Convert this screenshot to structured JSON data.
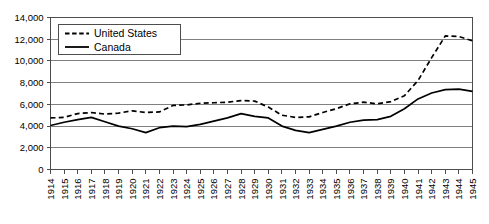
{
  "chart_data": {
    "type": "line",
    "title": "",
    "xlabel": "",
    "ylabel": "",
    "x": [
      1914,
      1915,
      1916,
      1917,
      1918,
      1919,
      1920,
      1921,
      1922,
      1923,
      1924,
      1925,
      1926,
      1927,
      1928,
      1929,
      1930,
      1931,
      1932,
      1933,
      1934,
      1935,
      1936,
      1937,
      1938,
      1939,
      1940,
      1941,
      1942,
      1943,
      1944,
      1945
    ],
    "xtick_labels": [
      "1914",
      "1915",
      "1916",
      "1917",
      "1918",
      "1919",
      "1920",
      "1921",
      "1922",
      "1923",
      "1924",
      "1925",
      "1926",
      "1927",
      "1928",
      "1929",
      "1930",
      "1931",
      "1932",
      "1933",
      "1934",
      "1935",
      "1936",
      "1937",
      "1938",
      "1939",
      "1940",
      "1941",
      "1942",
      "1943",
      "1944",
      "1945"
    ],
    "ytick_labels": [
      "0",
      "2,000",
      "4,000",
      "6,000",
      "8,000",
      "10,000",
      "12,000",
      "14,000"
    ],
    "yticks": [
      0,
      2000,
      4000,
      6000,
      8000,
      10000,
      12000,
      14000
    ],
    "ylim": [
      0,
      14000
    ],
    "grid": true,
    "legend_position": "top-left",
    "series": [
      {
        "name": "United States",
        "style": "dashed",
        "color": "#000000",
        "values": [
          4750,
          4800,
          5150,
          5250,
          5100,
          5200,
          5400,
          5250,
          5300,
          5900,
          5950,
          6100,
          6150,
          6200,
          6350,
          6300,
          5750,
          5000,
          4800,
          4850,
          5250,
          5600,
          6050,
          6200,
          6050,
          6250,
          6800,
          8200,
          10300,
          12300,
          12250,
          11850
        ]
      },
      {
        "name": "Canada",
        "style": "solid",
        "color": "#000000",
        "values": [
          4050,
          4350,
          4600,
          4800,
          4400,
          4000,
          3750,
          3400,
          3850,
          4000,
          3950,
          4150,
          4450,
          4750,
          5150,
          4900,
          4750,
          4000,
          3600,
          3400,
          3700,
          4000,
          4350,
          4550,
          4600,
          4900,
          5600,
          6500,
          7050,
          7350,
          7400,
          7200
        ]
      }
    ]
  },
  "legend": {
    "items": [
      {
        "label": "United States",
        "style": "dashed"
      },
      {
        "label": "Canada",
        "style": "solid"
      }
    ]
  }
}
